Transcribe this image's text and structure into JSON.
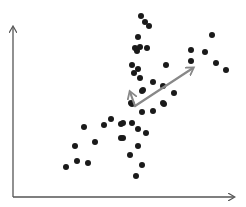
{
  "chart_data": {
    "type": "scatter",
    "title": "",
    "xlabel": "",
    "ylabel": "",
    "grid": false,
    "legend": null,
    "axes": {
      "origin_px": [
        13,
        197
      ],
      "x_end_px": [
        234,
        197
      ],
      "y_end_px": [
        13,
        27
      ],
      "color": "#555555",
      "x_ticks": [],
      "y_ticks": []
    },
    "point_color": "#1a1a1a",
    "point_radius": 3,
    "points_px": [
      [
        141,
        16
      ],
      [
        145,
        22
      ],
      [
        149,
        26
      ],
      [
        138,
        37
      ],
      [
        135,
        48
      ],
      [
        137,
        51
      ],
      [
        140,
        47
      ],
      [
        147,
        48
      ],
      [
        132,
        65
      ],
      [
        138,
        69
      ],
      [
        134,
        73
      ],
      [
        140,
        78
      ],
      [
        166,
        65
      ],
      [
        153,
        82
      ],
      [
        163,
        86
      ],
      [
        143,
        90
      ],
      [
        174,
        93
      ],
      [
        191,
        50
      ],
      [
        191,
        61
      ],
      [
        205,
        52
      ],
      [
        212,
        35
      ],
      [
        216,
        63
      ],
      [
        226,
        70
      ],
      [
        84,
        127
      ],
      [
        104,
        125
      ],
      [
        111,
        119
      ],
      [
        121,
        124
      ],
      [
        121,
        138
      ],
      [
        75,
        146
      ],
      [
        95,
        142
      ],
      [
        77,
        161
      ],
      [
        88,
        163
      ],
      [
        66,
        167
      ],
      [
        132,
        104
      ],
      [
        142,
        112
      ],
      [
        153,
        111
      ],
      [
        164,
        104
      ],
      [
        123,
        123
      ],
      [
        132,
        123
      ],
      [
        138,
        129
      ],
      [
        146,
        133
      ],
      [
        123,
        138
      ],
      [
        138,
        146
      ],
      [
        130,
        155
      ],
      [
        142,
        165
      ],
      [
        136,
        176
      ],
      [
        142,
        91
      ],
      [
        131,
        103
      ],
      [
        163,
        103
      ]
    ],
    "annotations": [
      {
        "type": "arrow",
        "label": "principal-component-1",
        "from_px": [
          135,
          106
        ],
        "to_px": [
          193,
          68
        ],
        "color": "#888888"
      },
      {
        "type": "arrow",
        "label": "principal-component-2",
        "from_px": [
          135,
          106
        ],
        "to_px": [
          130,
          92
        ],
        "color": "#888888"
      }
    ]
  }
}
